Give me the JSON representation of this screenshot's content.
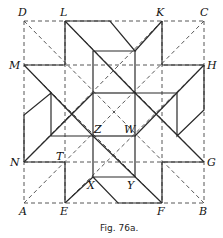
{
  "figure": {
    "caption": "Fig. 76a.",
    "labels": {
      "D": "D",
      "L": "L",
      "K": "K",
      "C": "C",
      "M": "M",
      "H": "H",
      "Z": "Z",
      "W": "W",
      "T": "T",
      "N": "N",
      "G": "G",
      "X": "X",
      "Y": "Y",
      "A": "A",
      "E": "E",
      "F": "F",
      "B": "B"
    },
    "colors": {
      "line": "#2a2a2a",
      "background": "#ffffff"
    }
  }
}
